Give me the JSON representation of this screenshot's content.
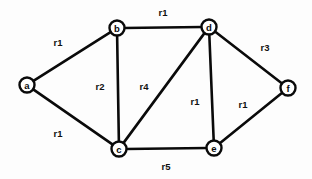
{
  "diagram": {
    "background_color": "#fdfdfd",
    "stroke_color": "#0a0a0a",
    "node_fill_color": "#ffffff",
    "node_radius": 7.5,
    "width": 312,
    "height": 179,
    "nodes": [
      {
        "id": "a",
        "label": "a",
        "x": 27,
        "y": 85
      },
      {
        "id": "b",
        "label": "b",
        "x": 117,
        "y": 28
      },
      {
        "id": "c",
        "label": "c",
        "x": 119,
        "y": 149
      },
      {
        "id": "d",
        "label": "d",
        "x": 209,
        "y": 27
      },
      {
        "id": "e",
        "label": "e",
        "x": 214,
        "y": 148
      },
      {
        "id": "f",
        "label": "f",
        "x": 288,
        "y": 88
      }
    ],
    "edges": [
      {
        "id": "a-b",
        "from": "a",
        "to": "b",
        "label": "r1",
        "label_x": 58,
        "label_y": 42
      },
      {
        "id": "a-c",
        "from": "a",
        "to": "c",
        "label": "r1",
        "label_x": 58,
        "label_y": 133
      },
      {
        "id": "b-c",
        "from": "b",
        "to": "c",
        "label": "r2",
        "label_x": 100,
        "label_y": 86
      },
      {
        "id": "b-d",
        "from": "b",
        "to": "d",
        "label": "r1",
        "label_x": 163,
        "label_y": 12
      },
      {
        "id": "c-d",
        "from": "c",
        "to": "d",
        "label": "r4",
        "label_x": 144,
        "label_y": 86
      },
      {
        "id": "c-e",
        "from": "c",
        "to": "e",
        "label": "r5",
        "label_x": 166,
        "label_y": 166
      },
      {
        "id": "d-e",
        "from": "d",
        "to": "e",
        "label": "r1",
        "label_x": 195,
        "label_y": 101
      },
      {
        "id": "d-f",
        "from": "d",
        "to": "f",
        "label": "r3",
        "label_x": 265,
        "label_y": 47
      },
      {
        "id": "e-f",
        "from": "e",
        "to": "f",
        "label": "r1",
        "label_x": 243,
        "label_y": 104
      }
    ]
  }
}
